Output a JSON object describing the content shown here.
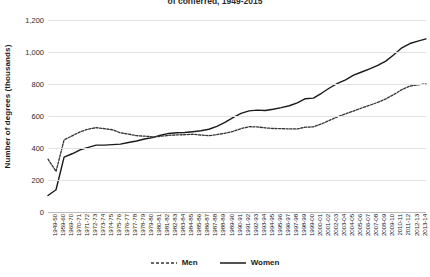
{
  "chart_data": {
    "type": "line",
    "title": "of conferred, 1949-2015",
    "xlabel": "",
    "ylabel": "Number of degrees (thousands)",
    "ylim": [
      0,
      1200
    ],
    "yticks": [
      0,
      200,
      400,
      600,
      800,
      1000,
      1200
    ],
    "ytick_labels": [
      "0",
      "200",
      "400",
      "600",
      "800",
      "1,000",
      "1,200"
    ],
    "grid": true,
    "legend_position": "bottom",
    "categories": [
      "1949-50",
      "1959-60",
      "1969-70",
      "1970-71",
      "1971-72",
      "1972-73",
      "1973-74",
      "1974-75",
      "1975-76",
      "1976-77",
      "1977-78",
      "1978-79",
      "1979-80",
      "1980-81",
      "1981-82",
      "1982-83",
      "1983-84",
      "1984-85",
      "1985-86",
      "1986-87",
      "1987-88",
      "1988-89",
      "1989-90",
      "1990-91",
      "1991-92",
      "1992-93",
      "1993-94",
      "1994-95",
      "1995-96",
      "1996-97",
      "1997-98",
      "1998-99",
      "1999-00",
      "2000-01",
      "2001-02",
      "2002-03",
      "2003-04",
      "2004-05",
      "2005-06",
      "2006-07",
      "2007-08",
      "2008-09",
      "2009-10",
      "2010-11",
      "2011-12",
      "2012-13",
      "2013-14",
      "2014-15"
    ],
    "series": [
      {
        "name": "Men",
        "style": "dashed",
        "color": "#333333",
        "values": [
          330,
          254,
          451,
          476,
          501,
          518,
          527,
          521,
          514,
          495,
          487,
          477,
          474,
          470,
          473,
          479,
          482,
          483,
          486,
          481,
          477,
          484,
          492,
          504,
          521,
          533,
          532,
          526,
          522,
          521,
          519,
          519,
          530,
          532,
          550,
          573,
          595,
          613,
          631,
          650,
          667,
          685,
          707,
          734,
          765,
          787,
          795,
          800
        ]
      },
      {
        "name": "Women",
        "style": "solid",
        "color": "#1a1a1a",
        "values": [
          103,
          139,
          343,
          364,
          389,
          404,
          418,
          418,
          421,
          424,
          434,
          444,
          456,
          465,
          480,
          491,
          495,
          497,
          502,
          508,
          517,
          535,
          560,
          590,
          616,
          632,
          637,
          634,
          642,
          652,
          664,
          682,
          708,
          712,
          742,
          775,
          804,
          826,
          855,
          875,
          895,
          916,
          943,
          983,
          1026,
          1053,
          1068,
          1082
        ]
      }
    ]
  },
  "legend": {
    "men_label": "Men",
    "women_label": "Women"
  }
}
